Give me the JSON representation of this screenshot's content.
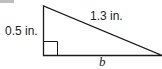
{
  "diagram": {
    "type": "right-triangle",
    "labels": {
      "height": "0.5 in.",
      "hypotenuse": "1.3 in.",
      "base": "b"
    },
    "colors": {
      "stroke": "#1a1a1a",
      "background": "#ffffff"
    }
  }
}
